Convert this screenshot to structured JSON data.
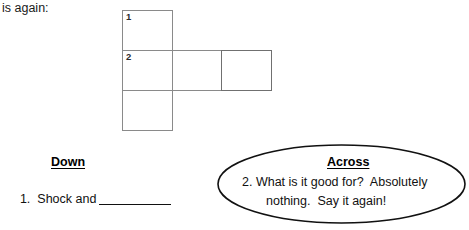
{
  "document": {
    "top_text": "is again:",
    "grid": {
      "cells": [
        {
          "id": "r1c1",
          "number": "1"
        },
        {
          "id": "r2c1",
          "number": "2"
        },
        {
          "id": "r3c1",
          "number": ""
        },
        {
          "id": "r2c2",
          "number": ""
        },
        {
          "id": "r2c3",
          "number": ""
        }
      ]
    },
    "down": {
      "heading": "Down",
      "clue_number": "1.",
      "clue_text": "Shock and"
    },
    "across": {
      "heading": "Across",
      "line_1": "2. What is it good for?  Absolutely",
      "line_2": "nothing.  Say it again!"
    }
  },
  "colors": {
    "grid_line": "#8a8a8a",
    "ink": "#111111",
    "page_background": "#ffffff"
  }
}
